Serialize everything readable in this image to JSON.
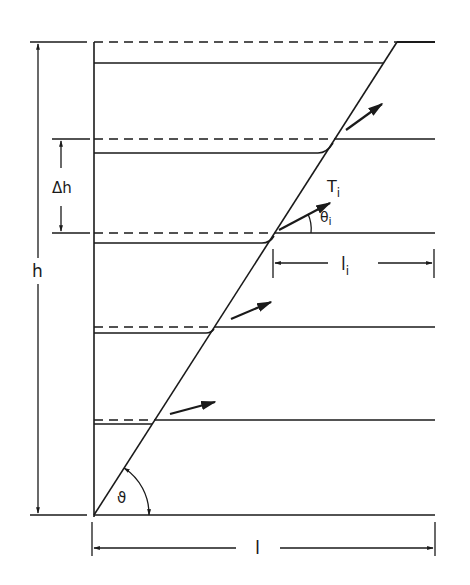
{
  "diagram": {
    "labels": {
      "height_total": "h",
      "layer_spacing": "Δh",
      "length_total": "l",
      "tension": "T",
      "tension_sub": "i",
      "angle": "θ",
      "angle_sub": "i",
      "anchorage_length": "l",
      "anchorage_length_sub": "i",
      "failure_angle": "ϑ"
    },
    "geometry": {
      "wall_x": 94,
      "top_y": 42,
      "base_y": 515,
      "right_x": 435,
      "failure_plane_top_x": 397
    },
    "layers": [
      {
        "dashed_y": 42,
        "solid_y": 63
      },
      {
        "dashed_y": 139,
        "solid_y": 153
      },
      {
        "dashed_y": 233,
        "solid_y": 243
      },
      {
        "dashed_y": 327,
        "solid_y": 333
      },
      {
        "dashed_y": 420,
        "solid_y": 424
      }
    ],
    "line_color": "#1a1a1a"
  }
}
